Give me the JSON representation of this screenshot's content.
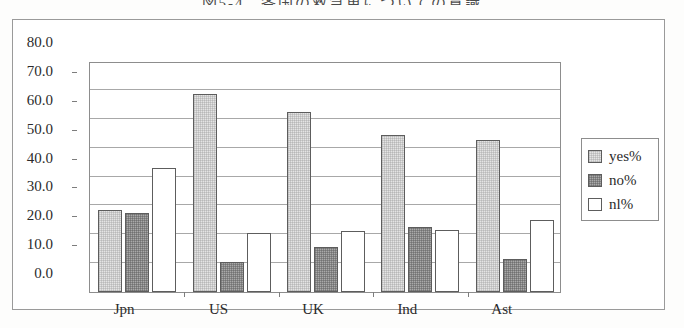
{
  "chart_data": {
    "type": "bar",
    "title": "図5-4　各国の救急車についての意識",
    "xlabel": "",
    "ylabel": "",
    "ylim": [
      0,
      80
    ],
    "ytick_step": 10,
    "ytick_labels": [
      "80.0",
      "70.0",
      "60.0",
      "50.0",
      "40.0",
      "30.0",
      "20.0",
      "10.0",
      "0.0"
    ],
    "ytick_values": [
      80,
      70,
      60,
      50,
      40,
      30,
      20,
      10,
      0
    ],
    "grid": true,
    "legend_position": "right",
    "categories": [
      "Jpn",
      "US",
      "UK",
      "Ind",
      "Ast"
    ],
    "series": [
      {
        "name": "yes%",
        "key": "yes",
        "color": "#e4e4e4",
        "values": [
          28.5,
          68.5,
          62.5,
          54.5,
          52.5
        ]
      },
      {
        "name": "no%",
        "key": "no",
        "color": "#a9a9a9",
        "values": [
          27.5,
          10.5,
          15.5,
          22.5,
          11.5
        ]
      },
      {
        "name": "nl%",
        "key": "nl",
        "color": "#ffffff",
        "values": [
          43.0,
          20.5,
          21.0,
          21.5,
          25.0
        ]
      }
    ]
  },
  "legend": {
    "items": [
      {
        "label": "yes%",
        "swatch": "yes"
      },
      {
        "label": "no%",
        "swatch": "no"
      },
      {
        "label": "nl%",
        "swatch": "nl"
      }
    ]
  }
}
